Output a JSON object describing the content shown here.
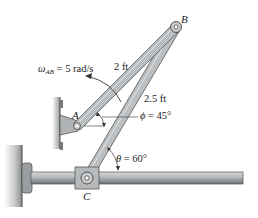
{
  "diagram": {
    "type": "mechanism",
    "points": {
      "A": {
        "label": "A"
      },
      "B": {
        "label": "B"
      },
      "C": {
        "label": "C"
      }
    },
    "members": [
      {
        "name": "AB",
        "length_label": "2 ft"
      },
      {
        "name": "BC",
        "length_label": "2.5 ft"
      }
    ],
    "angular_velocity": {
      "symbol": "ω",
      "subscript": "AB",
      "value_text": " = 5 rad/s"
    },
    "angles": {
      "phi": {
        "symbol": "ϕ",
        "value_text": " = 45°"
      },
      "theta": {
        "symbol": "θ",
        "value_text": " = 60°"
      }
    },
    "colors": {
      "member_fill": "#b9bcbd",
      "member_edge": "#5a5d5f",
      "rod_fill": "#a9acae",
      "wall_fill": "#8d9092",
      "text": "#222222"
    }
  }
}
